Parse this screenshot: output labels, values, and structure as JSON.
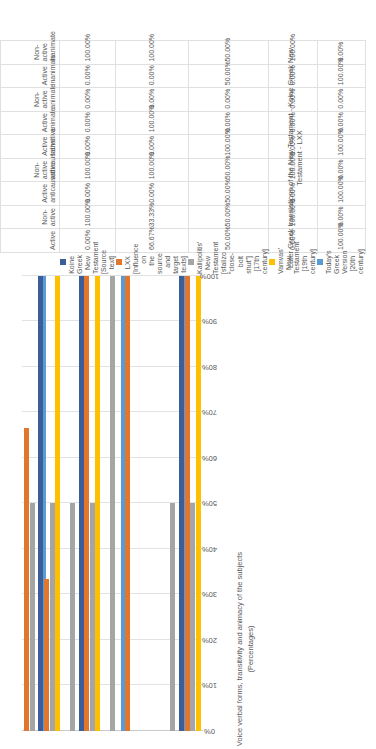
{
  "chart_data": {
    "type": "bar",
    "title": "",
    "orientation": "vertical-clustered",
    "ylabel": "Voice verbal forms, transitivity and animacy of the subjects (Percentages)",
    "xlabel": "",
    "ylim": [
      0,
      100
    ],
    "ytick_labels": [
      "0%",
      "10%",
      "20%",
      "30%",
      "40%",
      "50%",
      "60%",
      "70%",
      "80%",
      "90%",
      "100%"
    ],
    "grid": true,
    "legend_position": "bottom",
    "caption": "Later Greek translations of the New Testament - Koine Greek New Testament - LXX",
    "categories": [
      "Active",
      "Non-active",
      "Active anticausative",
      "Non-active anticausative",
      "Active transitive",
      "Active animate",
      "Non-active animate",
      "Active inanimate",
      "Non-active inanimate"
    ],
    "series": [
      {
        "name": "Koine Greek New Testament [Source text]",
        "color": "#3B5E9B",
        "values": [
          0.0,
          100.0,
          0.0,
          100.0,
          0.0,
          0.0,
          0.0,
          0.0,
          100.0
        ],
        "display": [
          "0.00%",
          "100.00%",
          "0.00%",
          "100.00%",
          "0.00%",
          "0.00%",
          "0.00%",
          "0.00%",
          "100.00%"
        ]
      },
      {
        "name": "LXX [Influence on the source and target texts]",
        "color": "#E2762B",
        "values": [
          66.67,
          33.33,
          0.0,
          100.0,
          0.0,
          100.0,
          0.0,
          0.0,
          100.0
        ],
        "display": [
          "66.67%",
          "33.33%",
          "0.00%",
          "100.00%",
          "0.00%",
          "100.00%",
          "0.00%",
          "0.00%",
          "100.00%"
        ]
      },
      {
        "name": "Kallipolitis' New Testament [sfalizo \"close-bolt shut\"] [17th century]",
        "color": "#A5A5A5",
        "values": [
          50.0,
          50.0,
          50.0,
          50.0,
          100.0,
          0.0,
          0.0,
          50.0,
          50.0
        ],
        "display": [
          "50.00%",
          "50.00%",
          "50.00%",
          "50.00%",
          "100.00%",
          "0.00%",
          "0.00%",
          "50.00%",
          "50.00%"
        ]
      },
      {
        "name": "Vamvas' New Testament [19th century]",
        "color": "#FFC000",
        "values": [
          0.0,
          100.0,
          0.0,
          100.0,
          0.0,
          0.0,
          0.0,
          0.0,
          100.0
        ],
        "display": [
          "0.00%",
          "100.00%",
          "0.00%",
          "100.00%",
          "0.00%",
          "0.00%",
          "0.00%",
          "0.00%",
          "100.00%"
        ]
      },
      {
        "name": "Today's Greek Version [20th century]",
        "color": "#5B9BD5",
        "values": [
          100.0,
          0.0,
          100.0,
          0.0,
          100.0,
          0.0,
          0.0,
          100.0,
          0.0
        ],
        "display": [
          "100.00%",
          "0.00%",
          "100.00%",
          "0.00%",
          "100.00%",
          "0.00%",
          "0.00%",
          "100.00%",
          "0.00%"
        ]
      }
    ],
    "table": {
      "column_groups": [
        {
          "header": "Active",
          "sub": [
            "Active",
            "Non-active"
          ]
        },
        {
          "header": "Active anticausative",
          "sub": [
            "Active anticausative",
            "Non-active anticausative"
          ]
        },
        {
          "header": "Active transitive",
          "sub": [
            "Active transitive"
          ]
        },
        {
          "header": "Active animate",
          "sub": [
            "Active animate",
            "Non-active animate"
          ]
        },
        {
          "header": "Active inanimate",
          "sub": [
            "Active inanimate",
            "Non-active inanimate"
          ]
        }
      ],
      "columns": [
        "Active",
        "Non-active",
        "Active anticausative",
        "Non-active anticausative",
        "Active transitive",
        "Active animate",
        "Non-active animate",
        "Active inanimate",
        "Non-active inanimate"
      ],
      "rows": [
        {
          "label": "Koine Greek New Testament [Source text]",
          "color": "#3B5E9B",
          "cells": [
            "0.00%",
            "100.00%",
            "0.00%",
            "100.00%",
            "0.00%",
            "0.00%",
            "0.00%",
            "0.00%",
            "100.00%"
          ]
        },
        {
          "label": "LXX [Influence on the source and target texts]",
          "color": "#E2762B",
          "cells": [
            "66.67%",
            "33.33%",
            "0.00%",
            "100.00%",
            "0.00%",
            "100.00%",
            "0.00%",
            "0.00%",
            "100.00%"
          ]
        },
        {
          "label": "Kallipolitis' New Testament [sfalizo \"close-bolt shut\"] [17th century]",
          "color": "#A5A5A5",
          "cells": [
            "50.00%",
            "50.00%",
            "50.00%",
            "50.00%",
            "100.00%",
            "0.00%",
            "0.00%",
            "50.00%",
            "50.00%"
          ]
        },
        {
          "label": "Vamvas' New Testament [19th century]",
          "color": "#FFC000",
          "cells": [
            "0.00%",
            "100.00%",
            "0.00%",
            "100.00%",
            "0.00%",
            "0.00%",
            "0.00%",
            "0.00%",
            "100.00%"
          ]
        },
        {
          "label": "Today's Greek Version [20th century]",
          "color": "#5B9BD5",
          "cells": [
            "100.00%",
            "0.00%",
            "100.00%",
            "0.00%",
            "100.00%",
            "0.00%",
            "0.00%",
            "100.00%",
            "0.00%"
          ]
        }
      ]
    }
  }
}
